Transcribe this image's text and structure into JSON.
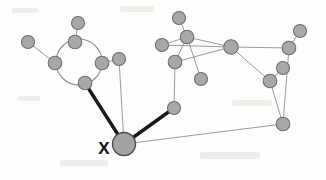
{
  "figure": {
    "background_color": "#fdfdfc",
    "width": 326,
    "height": 180
  },
  "legend": {
    "node_fill": "#a8a8a8",
    "node_stroke": "#6d6d6d",
    "thin_edge_color": "#8e8e8e",
    "thick_edge_color": "#1a1a1a",
    "label_color": "#111111"
  },
  "labels": [
    {
      "id": "label-x",
      "text": "X",
      "x": 104,
      "y": 154,
      "target_node": "n-x"
    }
  ],
  "chart_data": {
    "type": "diagram",
    "subtype": "node-link-graph",
    "node_radius_default": 6.5,
    "highlighted_node": "n-x",
    "nodes": [
      {
        "id": "n-left-outer",
        "x": 28,
        "y": 42,
        "r": 6.5,
        "highlight": false
      },
      {
        "id": "n-ring-left",
        "x": 55,
        "y": 63,
        "r": 6.8,
        "highlight": false
      },
      {
        "id": "n-ring-top",
        "x": 75,
        "y": 42,
        "r": 6.8,
        "highlight": false
      },
      {
        "id": "n-ring-right",
        "x": 102,
        "y": 63,
        "r": 6.8,
        "highlight": false
      },
      {
        "id": "n-ring-bottom",
        "x": 85,
        "y": 83,
        "r": 6.8,
        "highlight": false
      },
      {
        "id": "n-top-stub",
        "x": 78,
        "y": 23,
        "r": 6.5,
        "highlight": false
      },
      {
        "id": "n-right-stub",
        "x": 119,
        "y": 59,
        "r": 6.5,
        "highlight": false
      },
      {
        "id": "n-x",
        "x": 124,
        "y": 144,
        "r": 11.5,
        "highlight": true
      },
      {
        "id": "n-mid-low",
        "x": 174,
        "y": 108,
        "r": 6.5,
        "highlight": false
      },
      {
        "id": "n-mid-up",
        "x": 175,
        "y": 62,
        "r": 6.8,
        "highlight": false
      },
      {
        "id": "n-upper-a",
        "x": 187,
        "y": 37,
        "r": 6.8,
        "highlight": false
      },
      {
        "id": "n-upper-top",
        "x": 179,
        "y": 18,
        "r": 6.5,
        "highlight": false
      },
      {
        "id": "n-upper-left",
        "x": 162,
        "y": 45,
        "r": 6.5,
        "highlight": false
      },
      {
        "id": "n-below-a",
        "x": 201,
        "y": 79,
        "r": 6.5,
        "highlight": false
      },
      {
        "id": "n-hub",
        "x": 231,
        "y": 47,
        "r": 7.2,
        "highlight": false
      },
      {
        "id": "n-hub-low",
        "x": 270,
        "y": 81,
        "r": 6.8,
        "highlight": false
      },
      {
        "id": "n-right-a",
        "x": 289,
        "y": 48,
        "r": 6.8,
        "highlight": false
      },
      {
        "id": "n-right-top",
        "x": 300,
        "y": 31,
        "r": 6.5,
        "highlight": false
      },
      {
        "id": "n-right-mid",
        "x": 283,
        "y": 68,
        "r": 6.5,
        "highlight": false
      },
      {
        "id": "n-right-low",
        "x": 283,
        "y": 124,
        "r": 6.8,
        "highlight": false
      }
    ],
    "edges": [
      {
        "source": "n-left-outer",
        "target": "n-ring-left",
        "weight": "thin"
      },
      {
        "source": "n-ring-top",
        "target": "n-top-stub",
        "weight": "thin"
      },
      {
        "source": "n-ring-right",
        "target": "n-right-stub",
        "weight": "thin"
      },
      {
        "source": "n-right-stub",
        "target": "n-x",
        "weight": "thin"
      },
      {
        "source": "n-ring-bottom",
        "target": "n-x",
        "weight": "thick"
      },
      {
        "source": "n-x",
        "target": "n-mid-low",
        "weight": "thick"
      },
      {
        "source": "n-x",
        "target": "n-right-low",
        "weight": "thin"
      },
      {
        "source": "n-mid-low",
        "target": "n-mid-up",
        "weight": "thin"
      },
      {
        "source": "n-mid-up",
        "target": "n-upper-a",
        "weight": "thin"
      },
      {
        "source": "n-mid-up",
        "target": "n-hub",
        "weight": "thin"
      },
      {
        "source": "n-upper-a",
        "target": "n-upper-top",
        "weight": "thin"
      },
      {
        "source": "n-upper-a",
        "target": "n-upper-left",
        "weight": "thin"
      },
      {
        "source": "n-upper-a",
        "target": "n-hub",
        "weight": "thin"
      },
      {
        "source": "n-upper-a",
        "target": "n-below-a",
        "weight": "thin"
      },
      {
        "source": "n-upper-left",
        "target": "n-hub",
        "weight": "thin"
      },
      {
        "source": "n-hub",
        "target": "n-hub-low",
        "weight": "thin"
      },
      {
        "source": "n-hub",
        "target": "n-right-a",
        "weight": "thin"
      },
      {
        "source": "n-right-a",
        "target": "n-right-top",
        "weight": "thin"
      },
      {
        "source": "n-right-a",
        "target": "n-right-low",
        "weight": "thin"
      },
      {
        "source": "n-hub-low",
        "target": "n-right-mid",
        "weight": "thin"
      },
      {
        "source": "n-hub-low",
        "target": "n-right-low",
        "weight": "thin"
      }
    ],
    "ring": {
      "center_x": 79,
      "center_y": 62,
      "radius": 23,
      "member_nodes": [
        "n-ring-top",
        "n-ring-left",
        "n-ring-bottom",
        "n-ring-right"
      ]
    }
  }
}
